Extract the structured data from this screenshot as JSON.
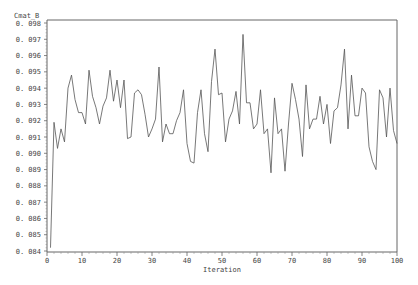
{
  "chart_data": {
    "type": "line",
    "title": "",
    "xlabel": "Iteration",
    "ylabel": "Cmat_B",
    "xlim": [
      0,
      100
    ],
    "ylim": [
      0.084,
      0.098
    ],
    "x_ticks": [
      0,
      10,
      20,
      30,
      40,
      50,
      60,
      70,
      80,
      90,
      100
    ],
    "x_tick_labels": [
      "0",
      "10",
      "20",
      "30",
      "40",
      "50",
      "60",
      "70",
      "80",
      "90",
      "100"
    ],
    "y_ticks": [
      0.084,
      0.085,
      0.086,
      0.087,
      0.088,
      0.089,
      0.09,
      0.091,
      0.092,
      0.093,
      0.094,
      0.095,
      0.096,
      0.097,
      0.098
    ],
    "y_tick_labels": [
      "0.084",
      "0.085",
      "0.086",
      "0.087",
      "0.088",
      "0.089",
      "0.090",
      "0.091",
      "0.092",
      "0.093",
      "0.094",
      "0.095",
      "0.096",
      "0.097",
      "0.098"
    ],
    "grid": false,
    "legend": null,
    "line_color": "#555555",
    "series": [
      {
        "name": "Cmat_B",
        "x": [
          1,
          2,
          3,
          4,
          5,
          6,
          7,
          8,
          9,
          10,
          11,
          12,
          13,
          14,
          15,
          16,
          17,
          18,
          19,
          20,
          21,
          22,
          23,
          24,
          25,
          26,
          27,
          28,
          29,
          30,
          31,
          32,
          33,
          34,
          35,
          36,
          37,
          38,
          39,
          40,
          41,
          42,
          43,
          44,
          45,
          46,
          47,
          48,
          49,
          50,
          51,
          52,
          53,
          54,
          55,
          56,
          57,
          58,
          59,
          60,
          61,
          62,
          63,
          64,
          65,
          66,
          67,
          68,
          69,
          70,
          71,
          72,
          73,
          74,
          75,
          76,
          77,
          78,
          79,
          80,
          81,
          82,
          83,
          84,
          85,
          86,
          87,
          88,
          89,
          90,
          91,
          92,
          93,
          94,
          95,
          96,
          97,
          98,
          99,
          100
        ],
        "values": [
          0.0842,
          0.0919,
          0.0903,
          0.0915,
          0.0907,
          0.094,
          0.0948,
          0.0933,
          0.0925,
          0.0925,
          0.0918,
          0.0951,
          0.0935,
          0.0928,
          0.0918,
          0.0929,
          0.0934,
          0.0951,
          0.0932,
          0.0945,
          0.0928,
          0.0945,
          0.0909,
          0.091,
          0.0937,
          0.0939,
          0.0936,
          0.0924,
          0.091,
          0.0915,
          0.0921,
          0.0953,
          0.0907,
          0.0918,
          0.0912,
          0.0912,
          0.092,
          0.0925,
          0.0939,
          0.0906,
          0.0895,
          0.0894,
          0.0925,
          0.0939,
          0.0912,
          0.0901,
          0.0944,
          0.0964,
          0.0936,
          0.0937,
          0.0907,
          0.0921,
          0.0926,
          0.0938,
          0.0918,
          0.0973,
          0.0931,
          0.0931,
          0.0915,
          0.0918,
          0.0939,
          0.0912,
          0.0915,
          0.0888,
          0.0934,
          0.0912,
          0.0915,
          0.0889,
          0.0918,
          0.0943,
          0.0933,
          0.0921,
          0.0898,
          0.0942,
          0.0915,
          0.0921,
          0.0921,
          0.0935,
          0.0918,
          0.093,
          0.0906,
          0.0926,
          0.0928,
          0.0942,
          0.0964,
          0.0915,
          0.0948,
          0.0923,
          0.0923,
          0.094,
          0.0937,
          0.0904,
          0.0895,
          0.089,
          0.0939,
          0.0934,
          0.091,
          0.094,
          0.0914,
          0.0906
        ]
      }
    ]
  },
  "labels": {
    "y_axis_title": "Cmat_B",
    "x_axis_title": "Iteration"
  }
}
